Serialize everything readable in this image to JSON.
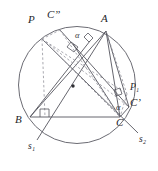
{
  "figure": {
    "kind": "geometry-diagram",
    "background_color": "#ffffff",
    "stroke_color": "#4a4a52",
    "dashed_color": "#8a8a93",
    "label_color": "#26262a"
  },
  "circle": {
    "name": "circumcircle",
    "cx": 77,
    "cy": 85,
    "r": 58.5,
    "center_dot": {
      "name": "circumcenter",
      "cx": 73,
      "cy": 86,
      "r": 1.6
    }
  },
  "points": {
    "A": {
      "x": 106,
      "y": 31,
      "label": "A",
      "label_x": 101,
      "label_y": 15
    },
    "B": {
      "x": 30,
      "y": 117,
      "label": "B",
      "label_x": 18,
      "label_y": 117
    },
    "C": {
      "x": 120,
      "y": 117,
      "label": "C",
      "label_x": 118,
      "label_y": 119
    },
    "P": {
      "x": 42,
      "y": 39,
      "label": "P",
      "label_x": 29,
      "label_y": 16
    },
    "Cpp": {
      "x": 60,
      "y": 30,
      "label": "C”",
      "label_x": 49,
      "label_y": 12
    },
    "Cp": {
      "x": 129,
      "y": 107,
      "label": "C’",
      "label_x": 132,
      "label_y": 100
    },
    "P1": {
      "x": 127,
      "y": 94,
      "label": "P₁",
      "label_x": 132,
      "label_y": 85
    },
    "S1": {
      "x": 37,
      "y": 140,
      "label": "s₁",
      "label_x": 30,
      "label_y": 144
    },
    "S2": {
      "x": 138,
      "y": 133,
      "label": "s₂",
      "label_x": 140,
      "label_y": 137
    }
  },
  "angles": [
    {
      "name": "alpha-upper",
      "label": "α",
      "x": 76,
      "y": 34
    },
    {
      "name": "alpha-lower",
      "label": "α",
      "x": 118,
      "y": 106
    }
  ],
  "right_angle_marks": [
    {
      "name": "right-angle-at-foot-on-bc",
      "cx": 45,
      "cy": 113
    },
    {
      "name": "right-angle-upper-center",
      "cx": 73,
      "cy": 48
    },
    {
      "name": "right-angle-near-a",
      "cx": 88,
      "cy": 40
    },
    {
      "name": "right-angle-near-p1",
      "cx": 118,
      "cy": 92
    }
  ]
}
